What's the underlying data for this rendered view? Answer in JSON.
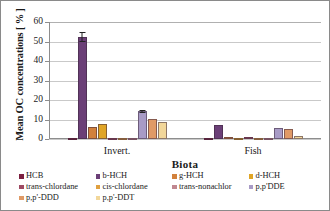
{
  "chart_data": {
    "type": "bar",
    "title": "",
    "xlabel": "Biota",
    "ylabel": "Mean OC concentrations [ % ]",
    "categories": [
      "Invert.",
      "Fish"
    ],
    "ylim": [
      0,
      60
    ],
    "yticks": [
      0,
      10,
      20,
      30,
      40,
      50,
      60
    ],
    "grid": true,
    "legend_position": "bottom",
    "series": [
      {
        "name": "HCB",
        "color": "#7b1f3f",
        "values": [
          0.4,
          0.5
        ],
        "errors": [
          0.2,
          0.2
        ]
      },
      {
        "name": "b-HCH",
        "color": "#6b3f77",
        "values": [
          52.5,
          7.3
        ],
        "errors": [
          2.6,
          0.4
        ]
      },
      {
        "name": "g-HCH",
        "color": "#d2813c",
        "values": [
          6.0,
          1.0
        ],
        "errors": [
          0.5,
          0.3
        ]
      },
      {
        "name": "d-HCH",
        "color": "#e0a526",
        "values": [
          7.9,
          0.6
        ],
        "errors": [
          0.4,
          0.2
        ]
      },
      {
        "name": "trans-chlordane",
        "color": "#9e4a63",
        "values": [
          0.2,
          0.8
        ],
        "errors": [
          0.1,
          0.2
        ]
      },
      {
        "name": "cis-chlordane",
        "color": "#e0a040",
        "values": [
          0.2,
          0.4
        ],
        "errors": [
          0.1,
          0.1
        ]
      },
      {
        "name": "trans-nonachlor",
        "color": "#c08790",
        "values": [
          0.2,
          0.5
        ],
        "errors": [
          0.1,
          0.1
        ]
      },
      {
        "name": "p,p'DDE",
        "color": "#a89bc6",
        "values": [
          14.2,
          5.7
        ],
        "errors": [
          0.7,
          0.5
        ]
      },
      {
        "name": "p,p'-DDD",
        "color": "#e09a66",
        "values": [
          10.5,
          5.3
        ],
        "errors": [
          0.4,
          0.4
        ]
      },
      {
        "name": "p,p'-DDT",
        "color": "#f2d79a",
        "values": [
          8.6,
          1.5
        ],
        "errors": [
          0.4,
          0.3
        ]
      }
    ]
  },
  "axis": {
    "y_title": "Mean OC concentrations [ % ]",
    "x_title": "Biota",
    "y_ticks": [
      "0",
      "10",
      "20",
      "30",
      "40",
      "50",
      "60"
    ],
    "x_ticks": [
      "Invert.",
      "Fish"
    ]
  },
  "legend": {
    "items": [
      {
        "label": "HCB",
        "color": "#7b1f3f"
      },
      {
        "label": "b-HCH",
        "color": "#6b3f77"
      },
      {
        "label": "g-HCH",
        "color": "#d2813c"
      },
      {
        "label": "d-HCH",
        "color": "#e0a526"
      },
      {
        "label": "trans-chlordane",
        "color": "#9e4a63"
      },
      {
        "label": "cis-chlordane",
        "color": "#e0a040"
      },
      {
        "label": "trans-nonachlor",
        "color": "#c08790"
      },
      {
        "label": "p,p'DDE",
        "color": "#a89bc6"
      },
      {
        "label": "p,p'-DDD",
        "color": "#e09a66"
      },
      {
        "label": "p,p'-DDT",
        "color": "#f2d79a"
      }
    ]
  }
}
